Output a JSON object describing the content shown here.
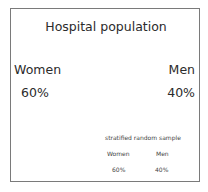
{
  "population": {
    "title": "Hospital population",
    "groups": [
      {
        "label": "Women",
        "percent": "60%"
      },
      {
        "label": "Men",
        "percent": "40%"
      }
    ]
  },
  "sample": {
    "title": "stratified random sample",
    "groups": [
      {
        "label": "Women",
        "percent": "60%"
      },
      {
        "label": "Men",
        "percent": "40%"
      }
    ]
  },
  "colors": {
    "border": "#7a7a7a",
    "text": "#2b2b2b",
    "background": "#ffffff"
  }
}
